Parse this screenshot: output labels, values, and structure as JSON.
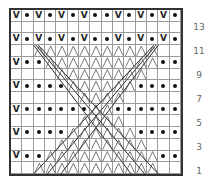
{
  "chart_data": {
    "type": "table",
    "columns": 15,
    "rows": 14,
    "row_labels": [
      "13",
      "11",
      "9",
      "7",
      "5",
      "3",
      "1"
    ],
    "legend_symbols": {
      "V": "slip stitch",
      "dot": "purl",
      "cable": "crossed / twisted stitches"
    },
    "grid_rows_top_to_bottom": [
      "V.V.V.V..V.V.V.",
      "               ",
      "V.V.V.V..V.V.V.",
      "  CCCCCCCCCCC  ",
      "V..CCCCCCCCCC..",
      "    CCCCCCCC   ",
      "V....CCCCCC....",
      "      CCCC     ",
      "V......CC......",
      "      CCCC     ",
      "V....CCCCCC....",
      "    CCCCCCCC   ",
      "V..CCCCCCCCCC..",
      "  CCCCCCCCCCC  "
    ]
  },
  "labels": {
    "r13": "13",
    "r11": "11",
    "r9": "9",
    "r7": "7",
    "r5": "5",
    "r3": "3",
    "r1": "1"
  },
  "colors": {
    "border": "#333333",
    "grid": "#9a9a9a",
    "symbol": "#111111",
    "label": "#666666"
  }
}
